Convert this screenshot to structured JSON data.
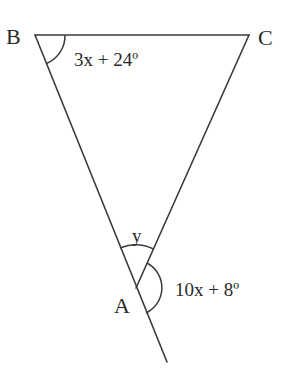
{
  "diagram": {
    "type": "geometry-triangle",
    "vertices": {
      "B": {
        "label": "B"
      },
      "C": {
        "label": "C"
      },
      "A": {
        "label": "A"
      }
    },
    "angles": {
      "B": {
        "label": "3x + 24º"
      },
      "A_interior": {
        "label": "y"
      },
      "A_exterior": {
        "label": "10x + 8º"
      }
    },
    "colors": {
      "stroke": "#3a3a3a",
      "text": "#2a2a2a",
      "background": "#ffffff"
    }
  }
}
